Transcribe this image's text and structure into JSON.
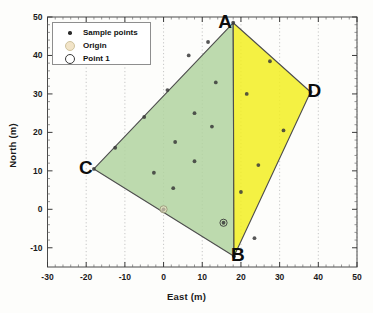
{
  "chart_data": {
    "type": "scatter",
    "title": "",
    "xlabel": "East (m)",
    "ylabel": "North (m)",
    "xlim": [
      -30,
      50
    ],
    "ylim": [
      -15,
      50
    ],
    "xticks": [
      -30,
      -20,
      -10,
      0,
      10,
      20,
      30,
      40,
      50
    ],
    "yticks": [
      -10,
      0,
      10,
      20,
      30,
      40,
      50
    ],
    "grid": "dotted-vertical",
    "legend": {
      "position": "top-left",
      "entries": [
        {
          "label": "Sample points",
          "marker": "dot",
          "color": "#2b2b2b"
        },
        {
          "label": "Origin",
          "marker": "circle",
          "color": "#f2e4c8"
        },
        {
          "label": "Point 1",
          "marker": "circle",
          "color": "#ffffff"
        }
      ]
    },
    "vertices": [
      {
        "name": "A",
        "x": 18.0,
        "y": 48.5,
        "label_dx": -9,
        "label_dy": -1
      },
      {
        "name": "B",
        "x": 18.2,
        "y": -12.2,
        "label_dx": 3,
        "label_dy": -1
      },
      {
        "name": "C",
        "x": -18.0,
        "y": 10.5,
        "label_dx": -9,
        "label_dy": -1
      },
      {
        "name": "D",
        "x": 38.0,
        "y": 30.5,
        "label_dx": 3,
        "label_dy": -1
      }
    ],
    "polygons": [
      {
        "name": "green-region-ACB",
        "fill": "#b2d4a0",
        "stroke": "#4d4d4d",
        "points": [
          [
            18.0,
            48.5
          ],
          [
            -18.0,
            10.5
          ],
          [
            18.2,
            -12.2
          ]
        ]
      },
      {
        "name": "yellow-region-ABD",
        "fill": "#f2ee22",
        "stroke": "#4d4d4d",
        "points": [
          [
            18.0,
            48.5
          ],
          [
            38.0,
            30.5
          ],
          [
            18.2,
            -12.2
          ]
        ]
      }
    ],
    "series": [
      {
        "name": "Sample points",
        "marker": "dot",
        "color": "#3a3a3a",
        "x": [
          18.0,
          11.5,
          6.5,
          1.0,
          -5.0,
          -12.5,
          -18.0,
          0.0,
          13.5,
          8.0,
          12.5,
          3.0,
          8.0,
          -2.5,
          2.5,
          15.5,
          18.2,
          27.5,
          38.0,
          21.5,
          31.0,
          24.5,
          20.0,
          23.5
        ],
        "y": [
          48.5,
          43.5,
          40.0,
          31.0,
          24.0,
          16.0,
          10.5,
          0.0,
          33.0,
          25.0,
          21.5,
          17.5,
          12.5,
          9.5,
          5.5,
          -3.5,
          -12.2,
          38.5,
          30.5,
          30.0,
          20.5,
          11.5,
          4.5,
          -7.5
        ]
      },
      {
        "name": "Origin",
        "marker": "open-circle",
        "fill": "#f2e4c8",
        "stroke": "#9a9a7a",
        "x": [
          0.0
        ],
        "y": [
          0.0
        ]
      },
      {
        "name": "Point 1",
        "marker": "open-circle",
        "fill": "none",
        "stroke": "#3a3a3a",
        "x": [
          15.5
        ],
        "y": [
          -3.5
        ]
      }
    ]
  }
}
